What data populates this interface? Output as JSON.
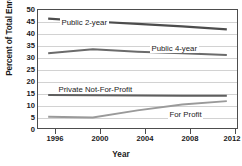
{
  "chart_data": {
    "type": "line",
    "title": "",
    "xlabel": "Year",
    "ylabel": "Percent of Total Enrollment",
    "x": [
      1996,
      2000,
      2004,
      2008,
      2012
    ],
    "xtick_labels": [
      "1996",
      "2000",
      "2004",
      "2008",
      "2012"
    ],
    "xlim": [
      1995,
      2013
    ],
    "ylim": [
      0,
      50
    ],
    "ytick_labels": [
      "0",
      "5",
      "10",
      "15",
      "20",
      "25",
      "30",
      "35",
      "40",
      "45",
      "50"
    ],
    "ytick_values": [
      0,
      5,
      10,
      15,
      20,
      25,
      30,
      35,
      40,
      45,
      50
    ],
    "grid": true,
    "legend_position": "inline-annotations",
    "series": [
      {
        "name": "Public 2-year",
        "label": "Public 2-year",
        "color": "#4d4d4d",
        "values": [
          46.0,
          44.8,
          43.8,
          42.8,
          41.5
        ]
      },
      {
        "name": "Public 4-year",
        "label": "Public 4-year",
        "color": "#6b6b6b",
        "values": [
          31.6,
          33.2,
          32.2,
          31.6,
          30.8
        ]
      },
      {
        "name": "Private Not-For-Profit",
        "label": "Private Not-For-Profit",
        "color": "#5e5e5e",
        "values": [
          14.2,
          14.1,
          14.0,
          13.9,
          13.9
        ]
      },
      {
        "name": "For Profit",
        "label": "For Profit",
        "color": "#9a9a9a",
        "values": [
          5.1,
          4.8,
          7.8,
          10.2,
          11.6
        ]
      }
    ]
  }
}
